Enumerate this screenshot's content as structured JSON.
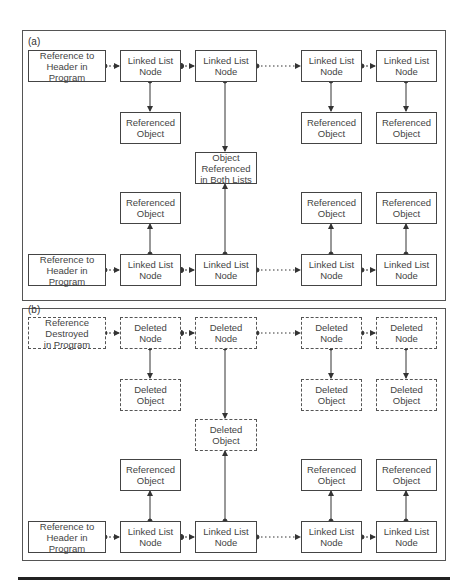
{
  "figure": {
    "panels": [
      {
        "label": "(a)",
        "top_row": [
          {
            "text": "Reference to\nHeader in Program",
            "style": "solid"
          },
          {
            "text": "Linked List\nNode",
            "style": "solid"
          },
          {
            "text": "Linked List\nNode",
            "style": "solid"
          },
          {
            "text": "Linked List\nNode",
            "style": "solid"
          },
          {
            "text": "Linked List\nNode",
            "style": "solid"
          }
        ],
        "top_objects": [
          {
            "text": "Referenced\nObject",
            "style": "solid"
          },
          {
            "text": "Referenced\nObject",
            "style": "solid"
          },
          {
            "text": "Referenced\nObject",
            "style": "solid"
          }
        ],
        "shared_object": {
          "text": "Object\nReferenced\nin Both Lists",
          "style": "solid"
        },
        "bottom_objects": [
          {
            "text": "Referenced\nObject",
            "style": "solid"
          },
          {
            "text": "Referenced\nObject",
            "style": "solid"
          },
          {
            "text": "Referenced\nObject",
            "style": "solid"
          }
        ],
        "bottom_row": [
          {
            "text": "Reference to\nHeader in Program",
            "style": "solid"
          },
          {
            "text": "Linked List\nNode",
            "style": "solid"
          },
          {
            "text": "Linked List\nNode",
            "style": "solid"
          },
          {
            "text": "Linked List\nNode",
            "style": "solid"
          },
          {
            "text": "Linked List\nNode",
            "style": "solid"
          }
        ]
      },
      {
        "label": "(b)",
        "top_row": [
          {
            "text": "Reference\nDestroyed\nin Program",
            "style": "dashed"
          },
          {
            "text": "Deleted\nNode",
            "style": "dashed"
          },
          {
            "text": "Deleted\nNode",
            "style": "dashed"
          },
          {
            "text": "Deleted\nNode",
            "style": "dashed"
          },
          {
            "text": "Deleted\nNode",
            "style": "dashed"
          }
        ],
        "top_objects": [
          {
            "text": "Deleted\nObject",
            "style": "dashed"
          },
          {
            "text": "Deleted\nObject",
            "style": "dashed"
          },
          {
            "text": "Deleted\nObject",
            "style": "dashed"
          }
        ],
        "shared_object": {
          "text": "Deleted\nObject",
          "style": "dashed"
        },
        "bottom_objects": [
          {
            "text": "Referenced\nObject",
            "style": "solid"
          },
          {
            "text": "Referenced\nObject",
            "style": "solid"
          },
          {
            "text": "Referenced\nObject",
            "style": "solid"
          }
        ],
        "bottom_row": [
          {
            "text": "Reference to\nHeader in Program",
            "style": "solid"
          },
          {
            "text": "Linked List\nNode",
            "style": "solid"
          },
          {
            "text": "Linked List\nNode",
            "style": "solid"
          },
          {
            "text": "Linked List\nNode",
            "style": "solid"
          },
          {
            "text": "Linked List\nNode",
            "style": "solid"
          }
        ]
      }
    ]
  }
}
